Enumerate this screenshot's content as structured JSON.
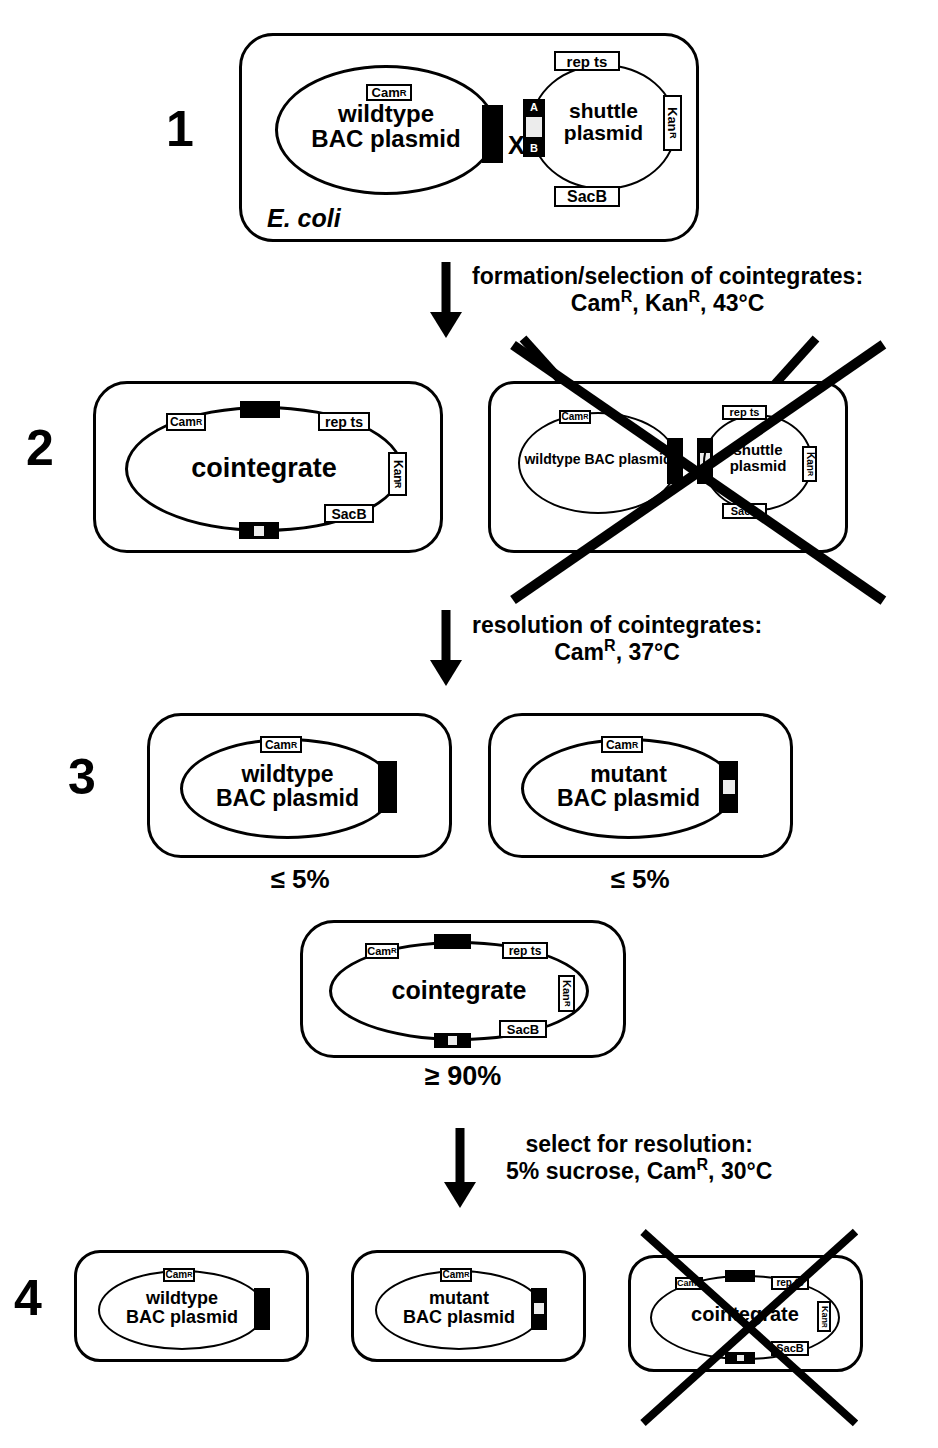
{
  "figure": {
    "organism_label": "E. coli",
    "cross_symbol": "X"
  },
  "genes": {
    "cam": "Cam",
    "cam_sup": "R",
    "kan": "Kan",
    "kan_sup": "R",
    "rep_ts": "rep ts",
    "sacb": "SacB",
    "region_a": "A",
    "region_b": "B"
  },
  "steps": [
    {
      "number": "1",
      "panels": [
        {
          "id": "step1-coli-cell",
          "crossed_out": false,
          "plasmids": [
            {
              "id": "wildtype-bac-plasmid",
              "label": "wildtype\nBAC plasmid"
            },
            {
              "id": "shuttle-plasmid",
              "label": "shuttle\nplasmid"
            }
          ]
        }
      ]
    },
    {
      "number": "2",
      "panels": [
        {
          "id": "step2-cointegrate-cell",
          "crossed_out": false,
          "plasmids": [
            {
              "id": "cointegrate-plasmid",
              "label": "cointegrate"
            }
          ]
        },
        {
          "id": "step2-rejected-cell",
          "crossed_out": true,
          "plasmids": [
            {
              "id": "wildtype-bac-plasmid",
              "label": "wildtype BAC plasmid"
            },
            {
              "id": "shuttle-plasmid",
              "label": "shuttle\nplasmid"
            }
          ]
        }
      ]
    },
    {
      "number": "3",
      "panels": [
        {
          "id": "step3-wildtype-cell",
          "crossed_out": false,
          "percentage": "≤  5%",
          "plasmids": [
            {
              "id": "wildtype-bac-plasmid",
              "label": "wildtype\nBAC plasmid"
            }
          ]
        },
        {
          "id": "step3-mutant-cell",
          "crossed_out": false,
          "percentage": "≤ 5%",
          "plasmids": [
            {
              "id": "mutant-bac-plasmid",
              "label": "mutant\nBAC plasmid"
            }
          ]
        },
        {
          "id": "step3-cointegrate-cell",
          "crossed_out": false,
          "percentage": "≥ 90%",
          "plasmids": [
            {
              "id": "cointegrate-plasmid",
              "label": "cointegrate"
            }
          ]
        }
      ]
    },
    {
      "number": "4",
      "panels": [
        {
          "id": "step4-wildtype-cell",
          "crossed_out": false,
          "plasmids": [
            {
              "id": "wildtype-bac-plasmid",
              "label": "wildtype\nBAC plasmid"
            }
          ]
        },
        {
          "id": "step4-mutant-cell",
          "crossed_out": false,
          "plasmids": [
            {
              "id": "mutant-bac-plasmid",
              "label": "mutant\nBAC plasmid"
            }
          ]
        },
        {
          "id": "step4-rejected-cointegrate-cell",
          "crossed_out": true,
          "plasmids": [
            {
              "id": "cointegrate-plasmid",
              "label": "cointegrate"
            }
          ]
        }
      ]
    }
  ],
  "transitions": [
    {
      "id": "transition-1-2",
      "line1": "formation/selection of cointegrates:",
      "line2_pre": "Cam",
      "line2_sup1": "R",
      "line2_mid": ", Kan",
      "line2_sup2": "R",
      "line2_post": ", 43°C"
    },
    {
      "id": "transition-2-3",
      "line1": "resolution of cointegrates:",
      "line2_pre": "Cam",
      "line2_sup1": "R",
      "line2_mid": "",
      "line2_sup2": "",
      "line2_post": ", 37°C"
    },
    {
      "id": "transition-3-4",
      "line1": "select for resolution:",
      "line2_pre": "5% sucrose, Cam",
      "line2_sup1": "R",
      "line2_mid": "",
      "line2_sup2": "",
      "line2_post": ", 30°C"
    }
  ],
  "colors": {
    "stroke": "#000000",
    "background": "#ffffff",
    "insert_fill": "#000000",
    "insert_window": "#ececec"
  }
}
